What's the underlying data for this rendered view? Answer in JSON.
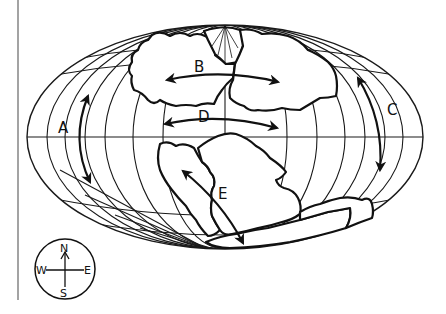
{
  "figure": {
    "type": "world map (Pangaea supercontinent, elliptical projection)",
    "colors": {
      "ink": "#111111",
      "background": "#ffffff"
    }
  },
  "labels": {
    "A": "A",
    "B": "B",
    "C": "C",
    "D": "D",
    "E": "E"
  },
  "arrows": [
    {
      "label": "A",
      "direction": "north-south (double-headed, curved along left meridian)"
    },
    {
      "label": "B",
      "direction": "west-east (double-headed, across northern landmass)"
    },
    {
      "label": "C",
      "direction": "north-south (double-headed, curved along right meridian)"
    },
    {
      "label": "D",
      "direction": "west-east (double-headed, just above equator)"
    },
    {
      "label": "E",
      "direction": "northwest-southeast (double-headed, across southern landmass)"
    }
  ],
  "compass": {
    "icon": "compass-rose-icon",
    "north": "N",
    "south": "S",
    "east": "E",
    "west": "W"
  }
}
